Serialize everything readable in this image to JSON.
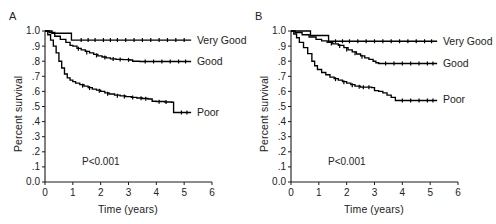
{
  "figure": {
    "panels": [
      {
        "id": "A",
        "label": "A",
        "pvalue": "P<0.001",
        "xlabel": "Time (years)",
        "ylabel": "Percent survival",
        "curve_labels": {
          "very_good": "Very Good",
          "good": "Good",
          "poor": "Poor"
        }
      },
      {
        "id": "B",
        "label": "B",
        "pvalue": "P<0.001",
        "xlabel": "Time (years)",
        "ylabel": "Percent survival",
        "curve_labels": {
          "very_good": "Very Good",
          "good": "Good",
          "poor": "Poor"
        }
      }
    ]
  },
  "chart_data": [
    {
      "type": "line",
      "title": "A",
      "subtitle": "",
      "xlabel": "Time (years)",
      "ylabel": "Percent survival",
      "xlim": [
        0,
        6
      ],
      "ylim": [
        0,
        1
      ],
      "xticks": [
        0,
        1,
        2,
        3,
        4,
        5,
        6
      ],
      "xticklabels": [
        "0",
        "1",
        "2",
        "3",
        "4",
        "5",
        "6"
      ],
      "yticks": [
        0.0,
        0.1,
        0.2,
        0.3,
        0.4,
        0.5,
        0.6,
        0.7,
        0.8,
        0.9,
        1.0
      ],
      "yticklabels": [
        "0.0",
        ".1",
        ".2",
        ".3",
        ".4",
        ".5",
        ".6",
        ".7",
        ".8",
        ".9",
        "1.0"
      ],
      "grid": false,
      "legend_position": "inline-right-of-curve",
      "annotations": [
        "P<0.001"
      ],
      "step_style": "post",
      "series": [
        {
          "name": "Very Good",
          "label_x": 5.35,
          "label_y": 0.94,
          "x": [
            0,
            0.1,
            0.25,
            0.85,
            0.95,
            5.25
          ],
          "y": [
            1.0,
            1.0,
            0.985,
            0.985,
            0.94,
            0.94
          ],
          "censor_x": [
            1.3,
            1.55,
            1.8,
            2.1,
            2.35,
            2.6,
            2.9,
            3.2,
            3.5,
            3.8,
            4.1,
            4.4,
            4.7,
            5.0
          ],
          "censor_y": [
            0.94,
            0.94,
            0.94,
            0.94,
            0.94,
            0.94,
            0.94,
            0.94,
            0.94,
            0.94,
            0.94,
            0.94,
            0.94,
            0.94
          ]
        },
        {
          "name": "Good",
          "label_x": 5.35,
          "label_y": 0.8,
          "x": [
            0,
            0.15,
            0.35,
            0.55,
            0.75,
            0.9,
            1.0,
            1.15,
            1.3,
            1.45,
            1.6,
            1.75,
            1.9,
            2.05,
            2.2,
            2.35,
            2.55,
            2.8,
            3.05,
            3.15,
            3.4,
            5.25
          ],
          "y": [
            1.0,
            0.99,
            0.965,
            0.945,
            0.925,
            0.905,
            0.9,
            0.885,
            0.875,
            0.865,
            0.855,
            0.845,
            0.835,
            0.828,
            0.822,
            0.815,
            0.812,
            0.81,
            0.808,
            0.8,
            0.798,
            0.798
          ],
          "censor_x": [
            1.2,
            1.5,
            1.85,
            2.15,
            2.45,
            2.7,
            3.0,
            3.6,
            3.9,
            4.2,
            4.5,
            4.8,
            5.05
          ],
          "censor_y": [
            0.882,
            0.858,
            0.838,
            0.824,
            0.814,
            0.812,
            0.809,
            0.798,
            0.798,
            0.798,
            0.798,
            0.798,
            0.798
          ]
        },
        {
          "name": "Poor",
          "label_x": 5.35,
          "label_y": 0.46,
          "x": [
            0,
            0.1,
            0.2,
            0.3,
            0.4,
            0.5,
            0.6,
            0.7,
            0.8,
            0.9,
            1.0,
            1.1,
            1.25,
            1.4,
            1.55,
            1.7,
            1.85,
            2.0,
            2.15,
            2.3,
            2.5,
            2.7,
            2.9,
            3.1,
            3.3,
            3.5,
            3.7,
            3.85,
            4.0,
            4.3,
            4.55,
            4.62,
            5.25
          ],
          "y": [
            1.0,
            0.975,
            0.94,
            0.9,
            0.855,
            0.8,
            0.755,
            0.715,
            0.69,
            0.675,
            0.665,
            0.655,
            0.645,
            0.635,
            0.625,
            0.615,
            0.608,
            0.6,
            0.59,
            0.583,
            0.575,
            0.57,
            0.565,
            0.56,
            0.556,
            0.553,
            0.55,
            0.535,
            0.533,
            0.53,
            0.528,
            0.46,
            0.46
          ],
          "censor_x": [
            1.35,
            1.6,
            1.95,
            2.25,
            2.6,
            2.85,
            3.15,
            3.45,
            3.62,
            4.1,
            4.35,
            4.9,
            5.1
          ],
          "censor_y": [
            0.638,
            0.622,
            0.604,
            0.585,
            0.572,
            0.566,
            0.559,
            0.554,
            0.552,
            0.532,
            0.53,
            0.46,
            0.46
          ]
        }
      ]
    },
    {
      "type": "line",
      "title": "B",
      "subtitle": "",
      "xlabel": "Time (years)",
      "ylabel": "Percent survival",
      "xlim": [
        0,
        6
      ],
      "ylim": [
        0,
        1
      ],
      "xticks": [
        0,
        1,
        2,
        3,
        4,
        5,
        6
      ],
      "xticklabels": [
        "0",
        "1",
        "2",
        "3",
        "4",
        "5",
        "6"
      ],
      "yticks": [
        0.0,
        0.1,
        0.2,
        0.3,
        0.4,
        0.5,
        0.6,
        0.7,
        0.8,
        0.9,
        1.0
      ],
      "yticklabels": [
        "0.0",
        ".1",
        ".2",
        ".3",
        ".4",
        ".5",
        ".6",
        ".7",
        ".8",
        ".9",
        "1.0"
      ],
      "grid": false,
      "legend_position": "inline-right-of-curve",
      "annotations": [
        "P<0.001"
      ],
      "step_style": "post",
      "series": [
        {
          "name": "Very Good",
          "label_x": 5.35,
          "label_y": 0.93,
          "x": [
            0,
            0.1,
            0.6,
            0.7,
            1.25,
            1.35,
            5.25
          ],
          "y": [
            1.0,
            1.0,
            1.0,
            0.97,
            0.97,
            0.932,
            0.932
          ],
          "censor_x": [
            1.6,
            1.85,
            2.1,
            2.4,
            2.7,
            3.0,
            3.3,
            3.6,
            3.9,
            4.2,
            4.5,
            4.8,
            5.05
          ],
          "censor_y": [
            0.932,
            0.932,
            0.932,
            0.932,
            0.932,
            0.932,
            0.932,
            0.932,
            0.932,
            0.932,
            0.932,
            0.932,
            0.932
          ]
        },
        {
          "name": "Good",
          "label_x": 5.35,
          "label_y": 0.785,
          "x": [
            0,
            0.15,
            0.4,
            0.65,
            0.9,
            1.1,
            1.3,
            1.5,
            1.7,
            1.9,
            2.05,
            2.2,
            2.35,
            2.5,
            2.65,
            2.8,
            2.95,
            3.05,
            3.15,
            5.25
          ],
          "y": [
            1.0,
            0.99,
            0.975,
            0.96,
            0.945,
            0.935,
            0.925,
            0.915,
            0.905,
            0.89,
            0.875,
            0.862,
            0.848,
            0.835,
            0.822,
            0.812,
            0.8,
            0.79,
            0.785,
            0.785
          ],
          "censor_x": [
            1.45,
            1.75,
            2.0,
            2.3,
            2.55,
            3.4,
            3.7,
            4.0,
            4.3,
            4.6,
            4.9,
            5.1
          ],
          "censor_y": [
            0.918,
            0.901,
            0.878,
            0.852,
            0.829,
            0.785,
            0.785,
            0.785,
            0.785,
            0.785,
            0.785,
            0.785
          ]
        },
        {
          "name": "Poor",
          "label_x": 5.35,
          "label_y": 0.545,
          "x": [
            0,
            0.1,
            0.2,
            0.3,
            0.45,
            0.6,
            0.75,
            0.85,
            0.95,
            1.1,
            1.25,
            1.4,
            1.55,
            1.7,
            1.85,
            2.0,
            2.15,
            2.3,
            2.5,
            2.7,
            2.9,
            3.0,
            3.15,
            3.3,
            3.45,
            3.6,
            3.75,
            5.25
          ],
          "y": [
            1.0,
            0.98,
            0.955,
            0.925,
            0.89,
            0.85,
            0.8,
            0.77,
            0.745,
            0.725,
            0.71,
            0.695,
            0.685,
            0.675,
            0.665,
            0.655,
            0.645,
            0.635,
            0.628,
            0.628,
            0.625,
            0.605,
            0.6,
            0.59,
            0.575,
            0.56,
            0.54,
            0.54
          ],
          "censor_x": [
            1.6,
            1.9,
            2.2,
            2.45,
            2.6,
            2.8,
            4.0,
            4.3,
            4.6,
            4.9,
            5.1
          ],
          "censor_y": [
            0.681,
            0.661,
            0.641,
            0.63,
            0.628,
            0.628,
            0.54,
            0.54,
            0.54,
            0.54,
            0.54
          ]
        }
      ]
    }
  ]
}
